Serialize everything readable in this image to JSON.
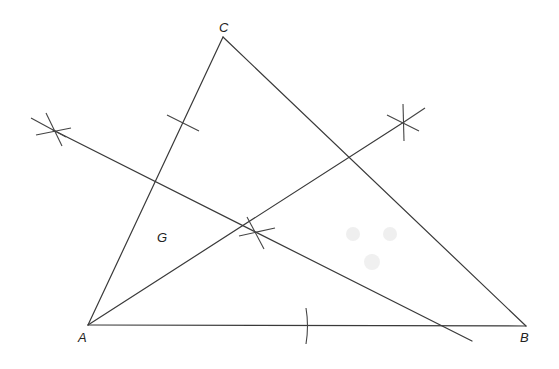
{
  "diagram": {
    "type": "geometry-construction",
    "points": {
      "A": {
        "label": "A",
        "x": 88,
        "y": 325
      },
      "B": {
        "label": "B",
        "x": 526,
        "y": 326
      },
      "C": {
        "label": "C",
        "x": 223,
        "y": 37
      },
      "G": {
        "label": "G",
        "x": 161,
        "y": 237
      }
    },
    "segments": [
      {
        "from": "A",
        "to": "B"
      },
      {
        "from": "B",
        "to": "C"
      },
      {
        "from": "C",
        "to": "A"
      }
    ],
    "construction_lines": [
      {
        "name": "line-from-A-through-arc-intersection",
        "x1": 88,
        "y1": 325,
        "x2": 404,
        "y2": 122
      },
      {
        "name": "line-from-left-arc-intersection",
        "x1": 53,
        "y1": 130,
        "x2": 472,
        "y2": 341
      }
    ],
    "arc_marks": [
      {
        "name": "tick-on-CA",
        "x": 183,
        "y": 124
      },
      {
        "name": "tick-on-AB",
        "x": 307,
        "y": 326
      },
      {
        "name": "arc-cross-left",
        "x": 53,
        "y": 130
      },
      {
        "name": "arc-cross-right",
        "x": 404,
        "y": 122
      },
      {
        "name": "arc-cross-middle",
        "x": 257,
        "y": 233
      }
    ]
  }
}
